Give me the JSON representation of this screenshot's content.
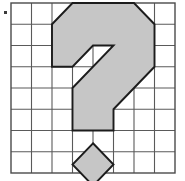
{
  "figure": {
    "canvas": {
      "width": 185,
      "height": 181
    },
    "background_color": "#ffffff",
    "corner_marker": {
      "name": "bullet-marker",
      "x": 4.0,
      "y": 11.0,
      "size": 3.0,
      "color": "#3a3a3a"
    },
    "grid": {
      "columns": 8,
      "rows": 8,
      "origin_x": 11.0,
      "origin_y": 3.0,
      "cell_width": 20.5,
      "cell_height": 21.25,
      "line_color": "#5a5a5a",
      "line_width": 1.1,
      "border_color": "#4a4a4a",
      "border_width": 1.4,
      "fill_color": "#ffffff"
    },
    "shapes": [
      {
        "name": "question-mark-body",
        "kind": "polygon",
        "fill_color": "#c6c6c6",
        "stroke_color": "#1c1c1c",
        "stroke_width": 1.9,
        "points_grid": [
          [
            3,
            0
          ],
          [
            6,
            0
          ],
          [
            7,
            1
          ],
          [
            7,
            3
          ],
          [
            5,
            5
          ],
          [
            5,
            6
          ],
          [
            3,
            6
          ],
          [
            3,
            4
          ],
          [
            5,
            2
          ],
          [
            4,
            2
          ],
          [
            3,
            3
          ],
          [
            2,
            3
          ],
          [
            2,
            1
          ]
        ]
      },
      {
        "name": "question-mark-dot",
        "kind": "polygon",
        "fill_color": "#c6c6c6",
        "stroke_color": "#1c1c1c",
        "stroke_width": 1.9,
        "points_grid": [
          [
            4,
            6.6
          ],
          [
            5,
            7.6
          ],
          [
            4,
            8.6
          ],
          [
            3,
            7.6
          ]
        ]
      }
    ]
  }
}
